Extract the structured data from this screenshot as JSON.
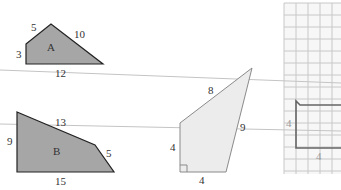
{
  "colors": {
    "dark_fill": "#a6a6a6",
    "dark_stroke": "#222222",
    "light_fill": "#ececec",
    "light_stroke": "#8a8a8a",
    "grid_line": "#c8c8c8",
    "grid_shape_stroke": "#666666",
    "scan_line": "#c4c4c4"
  },
  "shapes": {
    "shape_a": {
      "name": "A",
      "sides": {
        "left": "3",
        "top_left": "5",
        "top_right": "10",
        "bottom": "12"
      }
    },
    "shape_b": {
      "name": "B",
      "sides": {
        "left": "9",
        "top": "13",
        "right": "5",
        "bottom": "15"
      }
    },
    "quadrilateral": {
      "sides": {
        "top": "8",
        "right": "9",
        "left": "4",
        "bottom": "4"
      },
      "right_angle_marker": true
    },
    "grid_figure": {
      "sides": {
        "left": "4",
        "bottom": "4",
        "partial_right": "6"
      }
    }
  }
}
